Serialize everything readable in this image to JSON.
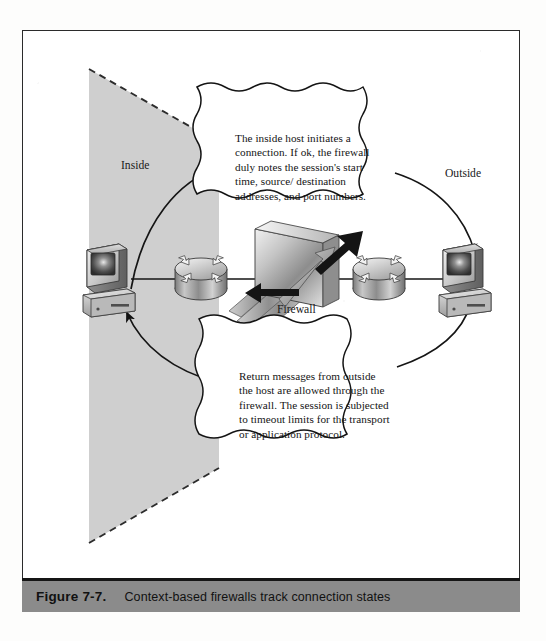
{
  "figure": {
    "label": "Figure 7-7.",
    "caption": "Context-based firewalls track connection states",
    "caption_bar_color": "#8b8b8b"
  },
  "diagram": {
    "type": "network-security-diagram",
    "zones": [
      {
        "name": "inside-zone",
        "label": "Inside"
      },
      {
        "name": "outside-zone",
        "label": "Outside"
      }
    ],
    "devices": [
      {
        "name": "inside-host",
        "icon": "desktop-computer-icon"
      },
      {
        "name": "inside-router",
        "icon": "router-icon"
      },
      {
        "name": "firewall",
        "icon": "firewall-slab-icon",
        "label": "Firewall"
      },
      {
        "name": "outside-router",
        "icon": "router-icon"
      },
      {
        "name": "outside-host",
        "icon": "desktop-computer-icon"
      }
    ],
    "flows": [
      {
        "name": "outbound-connection-flow",
        "direction": "inside-to-outside",
        "annotation_id": "callout-outbound"
      },
      {
        "name": "inbound-return-flow",
        "direction": "outside-to-inside",
        "annotation_id": "callout-inbound"
      }
    ],
    "callouts": [
      {
        "id": "callout-outbound",
        "name": "callout-outbound",
        "text": "The inside host initiates a connection. If ok, the firewall duly notes the session's start time, source/ destination addresses, and port numbers."
      },
      {
        "id": "callout-inbound",
        "name": "callout-inbound",
        "text": "Return messages from outside the host are allowed through the firewall. The session is subjected to timeout limits for the transport or application protocol."
      }
    ],
    "colors": {
      "inside_zone_fill": "#cfcfcf",
      "line": "#1a1a1a",
      "frame": "#2b2b2b",
      "device_light": "#e6e6e6",
      "device_mid": "#b5b5b5",
      "device_dark": "#6d6d6d",
      "screen_dark": "#3a3a3a"
    }
  }
}
